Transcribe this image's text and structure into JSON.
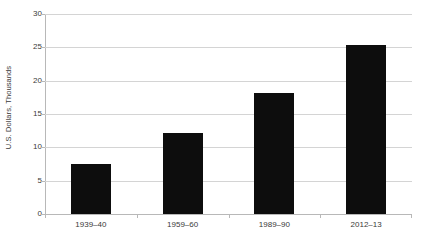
{
  "chart_data": {
    "type": "bar",
    "title": "",
    "subtitle": "",
    "xlabel": "",
    "ylabel": "U.S. Dollars, Thousands",
    "categories": [
      "1939–40",
      "1959–60",
      "1989–90",
      "2012–13"
    ],
    "values": [
      7.5,
      12.1,
      18.2,
      25.3
    ],
    "series": [
      {
        "name": "U.S. Dollars, Thousands",
        "values": [
          7.5,
          12.1,
          18.2,
          25.3
        ]
      }
    ],
    "ylim": [
      0,
      30
    ],
    "ytick_values": [
      0,
      5,
      10,
      15,
      20,
      25,
      30
    ],
    "ytick_labels": [
      "0",
      "5",
      "10",
      "15",
      "20",
      "25",
      "30"
    ],
    "grid": true,
    "grid_axis": "y",
    "legend": false,
    "legend_position": "none",
    "bar_color": "#0d0d0d",
    "gridline_color": "#d4d4d4",
    "axis_color": "#b8b8b8",
    "text_color": "#3a3a3a",
    "background_color": "#ffffff",
    "annotations": []
  }
}
